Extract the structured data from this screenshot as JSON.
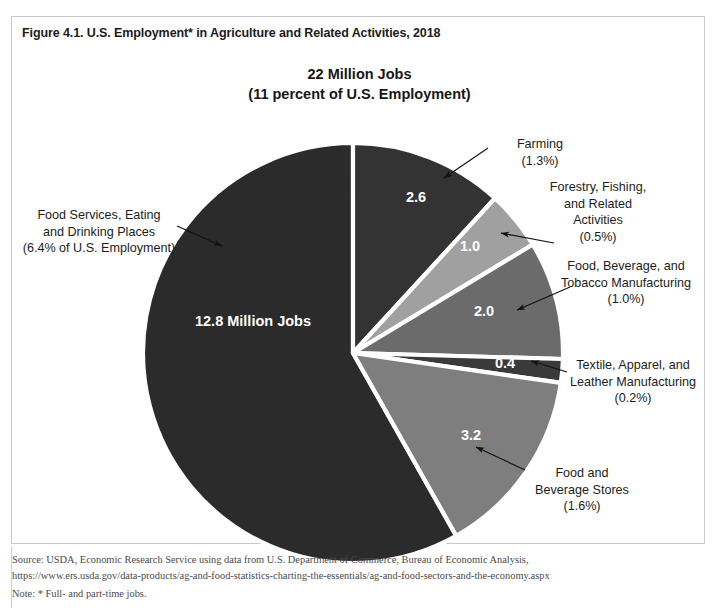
{
  "figure": {
    "caption": "Figure 4.1. U.S. Employment* in Agriculture and Related Activities, 2018",
    "headline_line1": "22 Million Jobs",
    "headline_line2": "(11 percent of U.S. Employment)"
  },
  "footer": {
    "source": "Source: USDA, Economic Research Service using data from U.S. Department of Commerce, Bureau of Economic Analysis,",
    "url": "https://www.ers.usda.gov/data-products/ag-and-food-statistics-charting-the-essentials/ag-and-food-sectors-and-the-economy.aspx",
    "note": "Note: * Full- and part-time jobs."
  },
  "colors": {
    "food_services": "#2b2b2b",
    "farming": "#333333",
    "forestry": "#a0a0a0",
    "food_bev_tobacco": "#6b6b6b",
    "textile": "#3a3a3a",
    "food_bev_stores": "#7e7e7e",
    "slice_divider": "#ffffff",
    "box_border": "#c9c9c9",
    "text": "#1c1c1c"
  },
  "chart_data": {
    "type": "pie",
    "title": "22 Million Jobs (11 percent of U.S. Employment)",
    "unit": "million jobs",
    "total": 22,
    "total_label": "22 Million Jobs",
    "total_share_of_us_employment": "11 percent",
    "legend": "none",
    "labels_position": "callout",
    "slices": [
      {
        "name": "Farming",
        "value": 2.6,
        "value_label": "2.6",
        "percent_label": "(1.3%)",
        "share_of_us_employment": 1.3,
        "color": "#333333",
        "callout_lines": [
          "Farming",
          "(1.3%)"
        ]
      },
      {
        "name": "Forestry, Fishing, and Related Activities",
        "value": 1.0,
        "value_label": "1.0",
        "percent_label": "(0.5%)",
        "share_of_us_employment": 0.5,
        "color": "#a0a0a0",
        "callout_lines": [
          "Forestry, Fishing,",
          "and Related",
          "Activities",
          "(0.5%)"
        ]
      },
      {
        "name": "Food, Beverage, and Tobacco Manufacturing",
        "value": 2.0,
        "value_label": "2.0",
        "percent_label": "(1.0%)",
        "share_of_us_employment": 1.0,
        "color": "#6b6b6b",
        "callout_lines": [
          "Food, Beverage, and",
          "Tobacco Manufacturing",
          "(1.0%)"
        ]
      },
      {
        "name": "Textile, Apparel, and Leather Manufacturing",
        "value": 0.4,
        "value_label": "0.4",
        "percent_label": "(0.2%)",
        "share_of_us_employment": 0.2,
        "color": "#3a3a3a",
        "callout_lines": [
          "Textile, Apparel, and",
          "Leather Manufacturing",
          "(0.2%)"
        ]
      },
      {
        "name": "Food and Beverage Stores",
        "value": 3.2,
        "value_label": "3.2",
        "percent_label": "(1.6%)",
        "share_of_us_employment": 1.6,
        "color": "#7e7e7e",
        "callout_lines": [
          "Food and",
          "Beverage Stores",
          "(1.6%)"
        ]
      },
      {
        "name": "Food Services, Eating and Drinking Places",
        "value": 12.8,
        "value_label": "12.8 Million Jobs",
        "percent_label": "(6.4% of U.S. Employment)",
        "share_of_us_employment": 6.4,
        "color": "#2b2b2b",
        "callout_lines": [
          "Food Services, Eating",
          "and Drinking Places",
          "(6.4% of U.S. Employment)"
        ]
      }
    ]
  }
}
